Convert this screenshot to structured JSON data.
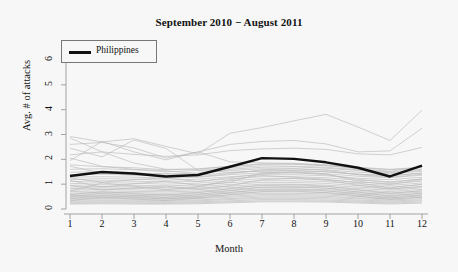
{
  "chart_data": {
    "type": "line",
    "title": "September 2010 − August 2011",
    "xlabel": "Month",
    "ylabel": "Avg. # of attacks",
    "xlim": [
      1,
      12
    ],
    "ylim": [
      0,
      6
    ],
    "xticks": [
      "1",
      "2",
      "3",
      "4",
      "5",
      "6",
      "7",
      "8",
      "9",
      "10",
      "11",
      "12"
    ],
    "yticks": [
      "0",
      "1",
      "2",
      "3",
      "4",
      "5",
      "6"
    ],
    "grid": false,
    "legend_position": "top-left",
    "legend": [
      {
        "name": "Philippines",
        "color": "#111111"
      }
    ],
    "x": [
      1,
      2,
      3,
      4,
      5,
      6,
      7,
      8,
      9,
      10,
      11,
      12
    ],
    "highlight_color": "#111111",
    "background_series_color": "#b8b8b8",
    "series": [
      {
        "name": "Philippines",
        "highlight": true,
        "values": [
          1.33,
          1.49,
          1.43,
          1.31,
          1.37,
          1.7,
          2.05,
          2.02,
          1.88,
          1.66,
          1.31,
          1.75
        ]
      },
      {
        "name": "country-01",
        "highlight": false,
        "values": [
          2.92,
          2.7,
          2.83,
          2.52,
          2.22,
          3.05,
          3.28,
          3.55,
          3.81,
          3.3,
          2.76,
          3.98
        ]
      },
      {
        "name": "country-02",
        "highlight": false,
        "values": [
          2.6,
          2.68,
          2.46,
          2.05,
          2.3,
          2.6,
          2.72,
          2.76,
          2.62,
          2.3,
          2.34,
          3.25
        ]
      },
      {
        "name": "country-03",
        "highlight": false,
        "values": [
          2.18,
          2.3,
          2.2,
          2.12,
          2.18,
          2.35,
          2.42,
          2.45,
          2.4,
          2.22,
          2.18,
          2.48
        ]
      },
      {
        "name": "country-04",
        "highlight": false,
        "values": [
          2.86,
          2.3,
          1.85,
          1.6,
          1.6,
          1.72,
          1.8,
          1.82,
          1.75,
          1.62,
          1.52,
          1.7
        ]
      },
      {
        "name": "country-05",
        "highlight": false,
        "values": [
          1.78,
          1.7,
          1.66,
          1.58,
          1.62,
          1.72,
          1.82,
          1.8,
          1.74,
          1.66,
          1.58,
          1.66
        ]
      },
      {
        "name": "country-06",
        "highlight": false,
        "values": [
          1.6,
          1.62,
          1.58,
          1.5,
          1.55,
          1.66,
          1.74,
          1.72,
          1.68,
          1.58,
          1.5,
          1.6
        ]
      },
      {
        "name": "country-07",
        "highlight": false,
        "values": [
          1.48,
          1.5,
          1.46,
          1.4,
          1.45,
          1.55,
          1.62,
          1.62,
          1.58,
          1.48,
          1.42,
          1.52
        ]
      },
      {
        "name": "country-08",
        "highlight": false,
        "values": [
          1.38,
          1.4,
          1.36,
          1.32,
          1.36,
          1.46,
          1.54,
          1.54,
          1.5,
          1.4,
          1.34,
          1.44
        ]
      },
      {
        "name": "country-09",
        "highlight": false,
        "values": [
          1.28,
          1.3,
          1.28,
          1.24,
          1.28,
          1.38,
          1.46,
          1.46,
          1.42,
          1.32,
          1.26,
          1.36
        ]
      },
      {
        "name": "country-10",
        "highlight": false,
        "values": [
          1.18,
          1.22,
          1.2,
          1.16,
          1.2,
          1.3,
          1.38,
          1.38,
          1.34,
          1.24,
          1.18,
          1.28
        ]
      },
      {
        "name": "country-11",
        "highlight": false,
        "values": [
          1.1,
          1.14,
          1.12,
          1.08,
          1.12,
          1.22,
          1.3,
          1.3,
          1.26,
          1.16,
          1.1,
          1.2
        ]
      },
      {
        "name": "country-12",
        "highlight": false,
        "values": [
          1.02,
          1.06,
          1.04,
          1.0,
          1.04,
          1.14,
          1.22,
          1.22,
          1.18,
          1.08,
          1.02,
          1.12
        ]
      },
      {
        "name": "country-13",
        "highlight": false,
        "values": [
          0.95,
          0.98,
          0.96,
          0.93,
          0.97,
          1.06,
          1.14,
          1.14,
          1.1,
          1.01,
          0.95,
          1.05
        ]
      },
      {
        "name": "country-14",
        "highlight": false,
        "values": [
          0.88,
          0.91,
          0.89,
          0.86,
          0.9,
          0.99,
          1.07,
          1.07,
          1.03,
          0.94,
          0.88,
          0.98
        ]
      },
      {
        "name": "country-15",
        "highlight": false,
        "values": [
          0.82,
          0.85,
          0.83,
          0.8,
          0.84,
          0.92,
          1.0,
          1.0,
          0.96,
          0.88,
          0.82,
          0.91
        ]
      },
      {
        "name": "country-16",
        "highlight": false,
        "values": [
          0.76,
          0.79,
          0.77,
          0.74,
          0.78,
          0.86,
          0.94,
          0.93,
          0.9,
          0.82,
          0.76,
          0.85
        ]
      },
      {
        "name": "country-17",
        "highlight": false,
        "values": [
          0.7,
          0.73,
          0.71,
          0.69,
          0.72,
          0.8,
          0.87,
          0.87,
          0.84,
          0.76,
          0.7,
          0.79
        ]
      },
      {
        "name": "country-18",
        "highlight": false,
        "values": [
          0.64,
          0.67,
          0.66,
          0.63,
          0.67,
          0.74,
          0.81,
          0.81,
          0.78,
          0.7,
          0.65,
          0.73
        ]
      },
      {
        "name": "country-19",
        "highlight": false,
        "values": [
          0.59,
          0.62,
          0.6,
          0.58,
          0.61,
          0.68,
          0.75,
          0.75,
          0.72,
          0.65,
          0.6,
          0.68
        ]
      },
      {
        "name": "country-20",
        "highlight": false,
        "values": [
          0.54,
          0.56,
          0.55,
          0.53,
          0.56,
          0.63,
          0.69,
          0.69,
          0.66,
          0.6,
          0.55,
          0.62
        ]
      },
      {
        "name": "country-21",
        "highlight": false,
        "values": [
          0.49,
          0.51,
          0.5,
          0.48,
          0.51,
          0.57,
          0.63,
          0.63,
          0.61,
          0.55,
          0.5,
          0.57
        ]
      },
      {
        "name": "country-22",
        "highlight": false,
        "values": [
          0.44,
          0.46,
          0.45,
          0.44,
          0.46,
          0.52,
          0.58,
          0.58,
          0.56,
          0.5,
          0.45,
          0.52
        ]
      },
      {
        "name": "country-23",
        "highlight": false,
        "values": [
          0.4,
          0.42,
          0.41,
          0.4,
          0.42,
          0.47,
          0.53,
          0.53,
          0.51,
          0.45,
          0.41,
          0.47
        ]
      },
      {
        "name": "country-24",
        "highlight": false,
        "values": [
          0.36,
          0.37,
          0.36,
          0.35,
          0.37,
          0.42,
          0.48,
          0.48,
          0.46,
          0.41,
          0.36,
          0.42
        ]
      },
      {
        "name": "country-25",
        "highlight": false,
        "values": [
          0.31,
          0.33,
          0.32,
          0.31,
          0.33,
          0.38,
          0.43,
          0.43,
          0.41,
          0.36,
          0.32,
          0.37
        ]
      },
      {
        "name": "country-26",
        "highlight": false,
        "values": [
          0.27,
          0.29,
          0.28,
          0.27,
          0.29,
          0.33,
          0.38,
          0.38,
          0.36,
          0.32,
          0.28,
          0.33
        ]
      },
      {
        "name": "country-27",
        "highlight": false,
        "values": [
          0.23,
          0.25,
          0.24,
          0.23,
          0.25,
          0.29,
          0.33,
          0.33,
          0.32,
          0.28,
          0.24,
          0.28
        ]
      },
      {
        "name": "country-28",
        "highlight": false,
        "values": [
          0.2,
          0.21,
          0.2,
          0.2,
          0.21,
          0.25,
          0.29,
          0.29,
          0.28,
          0.24,
          0.2,
          0.24
        ]
      },
      {
        "name": "country-29",
        "highlight": false,
        "values": [
          2.45,
          2.1,
          2.78,
          2.44,
          1.55,
          1.48,
          1.52,
          1.55,
          1.5,
          1.4,
          1.35,
          1.45
        ]
      },
      {
        "name": "country-30",
        "highlight": false,
        "values": [
          1.95,
          2.72,
          2.3,
          1.98,
          2.3,
          1.9,
          1.86,
          1.84,
          1.78,
          1.68,
          1.6,
          1.68
        ]
      },
      {
        "name": "country-31",
        "highlight": false,
        "values": [
          2.05,
          1.72,
          1.6,
          1.54,
          1.42,
          1.6,
          1.68,
          1.7,
          1.64,
          1.55,
          1.46,
          1.56
        ]
      },
      {
        "name": "country-32",
        "highlight": false,
        "values": [
          0.72,
          1.05,
          0.92,
          0.78,
          0.88,
          1.18,
          1.35,
          1.28,
          1.2,
          1.05,
          0.85,
          1.0
        ]
      },
      {
        "name": "country-33",
        "highlight": false,
        "values": [
          1.15,
          0.88,
          1.02,
          1.12,
          0.95,
          1.08,
          1.45,
          1.5,
          1.42,
          1.12,
          0.98,
          1.18
        ]
      },
      {
        "name": "country-34",
        "highlight": false,
        "values": [
          0.58,
          0.7,
          0.62,
          0.55,
          0.66,
          0.82,
          0.96,
          0.98,
          0.92,
          0.78,
          0.62,
          0.74
        ]
      },
      {
        "name": "country-35",
        "highlight": false,
        "values": [
          0.95,
          0.78,
          0.85,
          0.92,
          0.8,
          0.94,
          1.18,
          1.24,
          1.16,
          0.96,
          0.8,
          0.9
        ]
      },
      {
        "name": "country-36",
        "highlight": false,
        "values": [
          0.33,
          0.48,
          0.4,
          0.34,
          0.44,
          0.58,
          0.7,
          0.72,
          0.66,
          0.52,
          0.38,
          0.48
        ]
      },
      {
        "name": "country-37",
        "highlight": false,
        "values": [
          1.72,
          1.45,
          1.38,
          1.44,
          1.3,
          1.42,
          1.58,
          1.62,
          1.56,
          1.38,
          1.28,
          1.4
        ]
      },
      {
        "name": "country-38",
        "highlight": false,
        "values": [
          0.5,
          0.62,
          0.54,
          0.46,
          0.58,
          0.74,
          0.88,
          0.9,
          0.84,
          0.68,
          0.52,
          0.64
        ]
      },
      {
        "name": "country-39",
        "highlight": false,
        "values": [
          1.25,
          1.08,
          1.18,
          1.26,
          1.1,
          1.26,
          1.42,
          1.46,
          1.38,
          1.2,
          1.06,
          1.22
        ]
      },
      {
        "name": "country-40",
        "highlight": false,
        "values": [
          0.42,
          0.55,
          0.47,
          0.4,
          0.5,
          0.66,
          0.78,
          0.8,
          0.74,
          0.6,
          0.44,
          0.56
        ]
      }
    ]
  }
}
